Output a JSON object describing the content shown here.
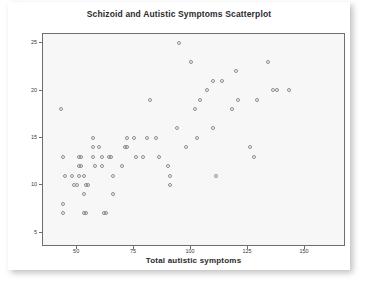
{
  "chart_data": {
    "type": "scatter",
    "title": "Schizoid and Autistic Symptoms Scatterplot",
    "xlabel": "Total autistic symptoms",
    "ylabel": "schizoid personality disorder",
    "xticks": [
      50,
      75,
      100,
      125,
      150
    ],
    "yticks": [
      5,
      10,
      15,
      20,
      25
    ],
    "xlim": [
      35,
      168
    ],
    "ylim": [
      3.5,
      26
    ],
    "grid": false,
    "legend": null,
    "marker": "open-circle",
    "marker_color": "#8d8d92",
    "plot_background": "#f7f7f7",
    "points": [
      [
        43,
        18
      ],
      [
        44,
        13
      ],
      [
        45,
        11
      ],
      [
        44,
        8
      ],
      [
        44,
        7
      ],
      [
        48,
        11
      ],
      [
        49,
        10
      ],
      [
        50,
        10
      ],
      [
        51,
        13
      ],
      [
        52,
        13
      ],
      [
        51,
        12
      ],
      [
        52,
        12
      ],
      [
        51,
        11
      ],
      [
        53,
        11
      ],
      [
        54,
        10
      ],
      [
        55,
        10
      ],
      [
        53,
        9
      ],
      [
        53,
        7
      ],
      [
        54,
        7
      ],
      [
        57,
        15
      ],
      [
        57,
        14
      ],
      [
        57,
        13
      ],
      [
        58,
        12
      ],
      [
        60,
        14
      ],
      [
        61,
        13
      ],
      [
        61,
        12
      ],
      [
        62,
        7
      ],
      [
        63,
        7
      ],
      [
        64,
        13
      ],
      [
        65,
        13
      ],
      [
        66,
        11
      ],
      [
        66,
        9
      ],
      [
        70,
        12
      ],
      [
        71,
        14
      ],
      [
        72,
        14
      ],
      [
        72,
        15
      ],
      [
        75,
        15
      ],
      [
        76,
        13
      ],
      [
        79,
        13
      ],
      [
        81,
        15
      ],
      [
        82,
        19
      ],
      [
        85,
        15
      ],
      [
        86,
        13
      ],
      [
        90,
        12
      ],
      [
        91,
        11
      ],
      [
        91,
        10
      ],
      [
        94,
        16
      ],
      [
        95,
        25
      ],
      [
        98,
        14
      ],
      [
        100,
        23
      ],
      [
        102,
        18
      ],
      [
        103,
        15
      ],
      [
        104,
        19
      ],
      [
        107,
        20
      ],
      [
        110,
        21
      ],
      [
        110,
        16
      ],
      [
        111,
        11
      ],
      [
        114,
        21
      ],
      [
        118,
        18
      ],
      [
        120,
        22
      ],
      [
        121,
        19
      ],
      [
        126,
        14
      ],
      [
        128,
        13
      ],
      [
        129,
        19
      ],
      [
        134,
        23
      ],
      [
        136,
        20
      ],
      [
        138,
        20
      ],
      [
        143,
        20
      ]
    ]
  }
}
